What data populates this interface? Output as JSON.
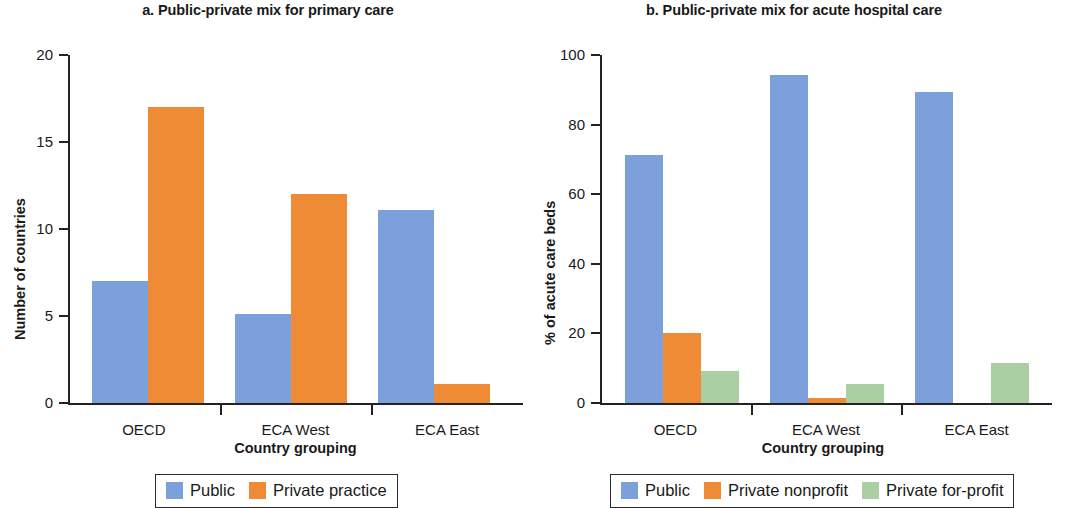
{
  "colors": {
    "public": "#7BA0DC",
    "private_practice": "#F08B35",
    "private_nonprofit": "#F08B35",
    "private_forprofit": "#A9CFA2",
    "axis": "#232323",
    "text": "#191919"
  },
  "panel_a": {
    "title": "a. Public-private mix for primary care",
    "ylabel": "Number of countries",
    "xlabel": "Country grouping",
    "yticks": [
      "0",
      "5",
      "10",
      "15",
      "20"
    ],
    "xticks": [
      "OECD",
      "ECA West",
      "ECA East"
    ],
    "legend": [
      {
        "label": "Public",
        "swatch": "public"
      },
      {
        "label": "Private practice",
        "swatch": "private_practice"
      }
    ]
  },
  "panel_b": {
    "title": "b. Public-private mix for acute hospital care",
    "ylabel": "% of acute care beds",
    "xlabel": "Country grouping",
    "yticks": [
      "0",
      "20",
      "40",
      "60",
      "80",
      "100"
    ],
    "xticks": [
      "OECD",
      "ECA West",
      "ECA East"
    ],
    "legend": [
      {
        "label": "Public",
        "swatch": "public"
      },
      {
        "label": "Private nonprofit",
        "swatch": "private_nonprofit"
      },
      {
        "label": "Private for-profit",
        "swatch": "private_forprofit"
      }
    ]
  },
  "chart_data": [
    {
      "type": "bar",
      "panel": "a",
      "title": "a. Public-private mix for primary care",
      "xlabel": "Country grouping",
      "ylabel": "Number of countries",
      "categories": [
        "OECD",
        "ECA West",
        "ECA East"
      ],
      "ylim": [
        0,
        20
      ],
      "yticks": [
        0,
        5,
        10,
        15,
        20
      ],
      "grid": false,
      "legend_position": "bottom",
      "series": [
        {
          "name": "Public",
          "color": "#7BA0DC",
          "values": [
            7,
            5.1,
            11.1
          ]
        },
        {
          "name": "Private practice",
          "color": "#F08B35",
          "values": [
            17,
            12,
            1.1
          ]
        }
      ]
    },
    {
      "type": "bar",
      "panel": "b",
      "title": "b. Public-private mix for acute hospital care",
      "xlabel": "Country grouping",
      "ylabel": "% of acute care beds",
      "categories": [
        "OECD",
        "ECA West",
        "ECA East"
      ],
      "ylim": [
        0,
        100
      ],
      "yticks": [
        0,
        20,
        40,
        60,
        80,
        100
      ],
      "grid": false,
      "legend_position": "bottom",
      "series": [
        {
          "name": "Public",
          "color": "#7BA0DC",
          "values": [
            71.3,
            94.4,
            89.4
          ]
        },
        {
          "name": "Private nonprofit",
          "color": "#F08B35",
          "values": [
            20,
            1.3,
            0
          ]
        },
        {
          "name": "Private for-profit",
          "color": "#A9CFA2",
          "values": [
            9.3,
            5.4,
            11.6
          ]
        }
      ]
    }
  ]
}
